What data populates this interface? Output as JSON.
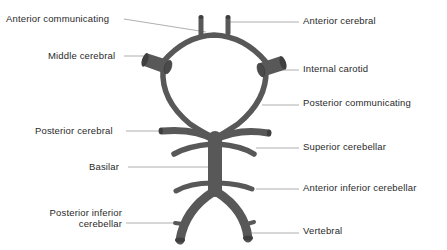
{
  "diagram": {
    "colors": {
      "vessel": "#585858",
      "vessel_end": "#3f3f3f",
      "leader_line": "#9a9a9a",
      "text": "#2a2a2a",
      "background": "#ffffff"
    },
    "labels_left": [
      {
        "id": "anterior-communicating",
        "text": "Anterior communicating"
      },
      {
        "id": "middle-cerebral",
        "text": "Middle cerebral"
      },
      {
        "id": "posterior-cerebral",
        "text": "Posterior cerebral"
      },
      {
        "id": "basilar",
        "text": "Basilar"
      },
      {
        "id": "posterior-inferior-cerebellar",
        "line1": "Posterior inferior",
        "line2": "cerebellar"
      }
    ],
    "labels_right": [
      {
        "id": "anterior-cerebral",
        "text": "Anterior cerebral"
      },
      {
        "id": "internal-carotid",
        "text": "Internal carotid"
      },
      {
        "id": "posterior-communicating",
        "text": "Posterior communicating"
      },
      {
        "id": "superior-cerebellar",
        "text": "Superior cerebellar"
      },
      {
        "id": "anterior-inferior-cerebellar",
        "text": "Anterior inferior cerebellar"
      },
      {
        "id": "vertebral",
        "text": "Vertebral"
      }
    ]
  }
}
